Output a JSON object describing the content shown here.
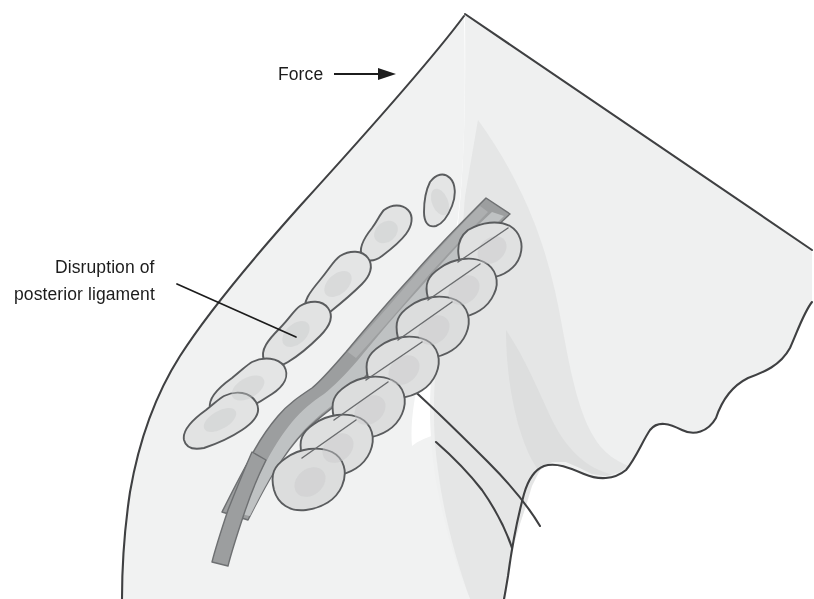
{
  "figure": {
    "title": "Cervical spine flexion injury",
    "width": 814,
    "height": 599,
    "background_color": "#ffffff"
  },
  "labels": {
    "force": {
      "text": "Force",
      "x": 278,
      "y": 80,
      "arrow_icon": "right-arrow-icon",
      "arrow_from_x": 334,
      "arrow_to_x": 392,
      "arrow_y": 74
    },
    "disruption": {
      "line1": "Disruption of",
      "line2": "posterior ligament",
      "x": 55,
      "y1": 273,
      "y2": 300,
      "leader_from_x": 177,
      "leader_from_y": 284,
      "leader_to_x": 296,
      "leader_to_y": 337
    }
  },
  "colors": {
    "body_fill": "#f1f2f2",
    "head_fill": "#eff0f0",
    "shadow_fill": "#e2e3e3",
    "shadow_fill_deep": "#dcdddd",
    "outline_stroke": "#3f4042",
    "bone_fill": "#dedfdf",
    "bone_fill_light": "#e8e9e9",
    "bone_shade": "#c9cacb",
    "bone_stroke": "#5a5c5e",
    "canal_fill": "#9c9e9f",
    "canal_inner": "#c4c6c7",
    "canal_stroke": "#6e7072",
    "text_color": "#1c1c1c"
  },
  "anatomy": {
    "spinal_canal_name": "spinal-canal-band",
    "vertebral_bodies_count": 7,
    "spinous_processes_count": 6,
    "regions": [
      "posterior-torso",
      "head-and-skull",
      "facial-profile",
      "neck-shadow",
      "cervical-spine"
    ]
  }
}
